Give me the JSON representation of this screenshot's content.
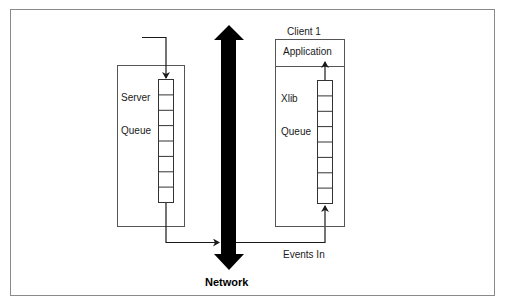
{
  "diagram": {
    "server": {
      "label_line1": "Server",
      "label_line2": "Queue",
      "queue_cells": 8
    },
    "client": {
      "title": "Client 1",
      "application_label": "Application",
      "queue_label_line1": "Xlib",
      "queue_label_line2": "Queue",
      "queue_cells": 8
    },
    "network": {
      "label": "Network"
    },
    "events_label": "Events In",
    "colors": {
      "line": "#1a1a1a",
      "box_border": "#555555",
      "frame_border": "#8a8a8a",
      "network_arrow": "#000000"
    }
  }
}
